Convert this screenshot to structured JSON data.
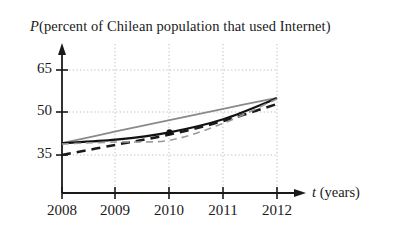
{
  "chart_data": {
    "type": "line",
    "title_var": "P",
    "title_rest": "(percent of Chilean population that used Internet)",
    "xlabel": "t (years)",
    "xlabel_var": "t",
    "xlabel_rest": "(years)",
    "ylabel": "",
    "xlim": [
      2008,
      2012.35
    ],
    "ylim": [
      20,
      71
    ],
    "grid": true,
    "grid_style": "dotted",
    "legend": "none",
    "x": [
      2008,
      2009,
      2010,
      2011,
      2012
    ],
    "xtick_labels": [
      "2008",
      "2009",
      "2010",
      "2011",
      "2012"
    ],
    "ytick_values": [
      35,
      50,
      65
    ],
    "ytick_labels": [
      "35",
      "50",
      "65"
    ],
    "series": [
      {
        "name": "gray-upper-line",
        "style": "solid",
        "color": "#8a8a8a",
        "width": 1.8,
        "x": [
          2008,
          2009,
          2010,
          2011,
          2012
        ],
        "values": [
          39.2,
          43.3,
          47.3,
          51.3,
          55.2
        ]
      },
      {
        "name": "solid-black-curve",
        "style": "solid",
        "color": "#111111",
        "width": 2.2,
        "x": [
          2008,
          2009,
          2010,
          2011,
          2012
        ],
        "values": [
          39.2,
          40.4,
          43.0,
          47.6,
          55.0
        ]
      },
      {
        "name": "thick-dashed-curve",
        "style": "dashed",
        "color": "#1a1a1a",
        "width": 2.6,
        "x": [
          2008,
          2009,
          2010,
          2011,
          2012
        ],
        "values": [
          35.0,
          38.6,
          42.2,
          47.0,
          53.0
        ]
      },
      {
        "name": "thin-gray-dashed-curve",
        "style": "dashed",
        "color": "#9a9a9a",
        "width": 1.6,
        "x": [
          2008,
          2009,
          2010,
          2011,
          2012
        ],
        "values": [
          38.9,
          39.6,
          40.2,
          46.2,
          54.8
        ]
      }
    ],
    "markers": [
      {
        "name": "point-2010",
        "x": 2010,
        "y": 43.0,
        "color": "#111111"
      }
    ],
    "axis_color": "#1a1a1a",
    "gridline_color": "#b9b9b9"
  }
}
